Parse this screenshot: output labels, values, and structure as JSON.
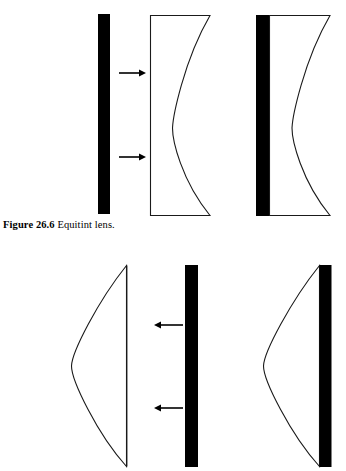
{
  "figure": {
    "caption_label": "Figure 26.6",
    "caption_text": "Equitint lens.",
    "colors": {
      "ink": "#000000",
      "background": "#ffffff",
      "outline": "#1a1a1a"
    }
  },
  "panels": {
    "top": {
      "name": "equitint-lens-with-separate-tint-plate",
      "elements": {
        "tint_plate": {
          "label": "tint-plate",
          "shape": "filled-vertical-bar",
          "x": 98,
          "y": 14,
          "width": 12,
          "height": 200
        },
        "arrows": [
          {
            "label": "light-ray-upper",
            "direction": "right",
            "x1": 119,
            "y": 73,
            "x2": 146
          },
          {
            "label": "light-ray-lower",
            "direction": "right",
            "x1": 119,
            "y": 157,
            "x2": 146
          }
        ],
        "lens_plain": {
          "label": "plano-concave-lens-outline",
          "shape": "flat-left-concave-right",
          "x": 150,
          "y": 15,
          "width": 60,
          "height": 201,
          "sagitta": 38
        },
        "lens_tinted": {
          "label": "plano-concave-lens-with-bonded-tint",
          "shape": "flat-left-concave-right",
          "x": 269,
          "y": 15,
          "width": 61,
          "height": 201,
          "sagitta": 38,
          "tint_bar": {
            "x": 256,
            "y": 15,
            "width": 13,
            "height": 201
          }
        }
      }
    },
    "bottom": {
      "name": "equitint-lens-convex-configuration",
      "elements": {
        "lens_plain": {
          "label": "plano-convex-lens-outline",
          "shape": "convex-left-flat-right",
          "x": 71,
          "y": 265,
          "width": 56,
          "height": 202,
          "sagitta": 56
        },
        "arrows": [
          {
            "label": "light-ray-upper",
            "direction": "left",
            "x1": 183,
            "y": 325,
            "x2": 154
          },
          {
            "label": "light-ray-lower",
            "direction": "left",
            "x1": 183,
            "y": 408,
            "x2": 154
          }
        ],
        "tint_plate": {
          "label": "tint-plate",
          "shape": "filled-vertical-bar",
          "x": 185,
          "y": 265,
          "width": 13,
          "height": 202
        },
        "lens_tinted": {
          "label": "plano-convex-lens-with-bonded-tint",
          "shape": "convex-left-flat-right",
          "x": 263,
          "y": 265,
          "width": 57,
          "height": 202,
          "sagitta": 57,
          "tint_bar": {
            "x": 320,
            "y": 265,
            "width": 12,
            "height": 202
          }
        }
      }
    }
  }
}
